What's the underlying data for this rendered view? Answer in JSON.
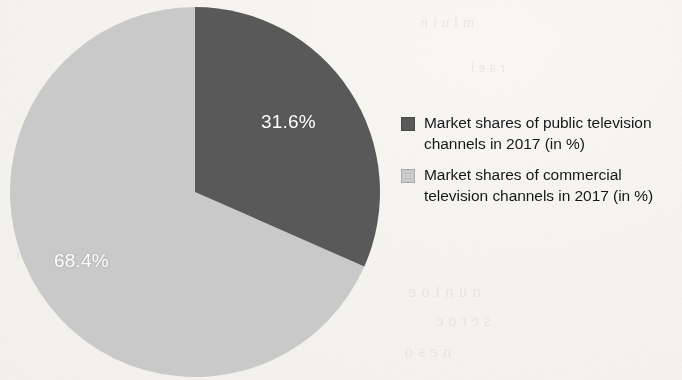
{
  "chart_data": {
    "type": "pie",
    "title": "",
    "subtitle": "",
    "xlabel": "",
    "ylabel": "",
    "units": "%",
    "legend_position": "right",
    "grid": false,
    "categories": [
      "Market shares of public television channels in 2017 (in %)",
      "Market shares of commercial television channels in 2017 (in %)"
    ],
    "values": [
      31.6,
      68.4
    ],
    "labels": [
      "31.6%",
      "68.4%"
    ],
    "colors": [
      "#595959",
      "#c9c9c9"
    ],
    "slices": [
      {
        "name": "Market shares of public television channels in 2017 (in %)",
        "value": 31.6,
        "label": "31.6%",
        "color": "#595959",
        "start_angle_deg": 0,
        "end_angle_deg": 113.76
      },
      {
        "name": "Market shares of commercial television channels in 2017 (in %)",
        "value": 68.4,
        "label": "68.4%",
        "color": "#c9c9c9",
        "start_angle_deg": 113.76,
        "end_angle_deg": 360
      }
    ]
  },
  "pie": {
    "slice_public_label": "31.6%",
    "slice_commercial_label": "68.4%",
    "center_x": 195,
    "center_y": 192,
    "radius": 185,
    "public_color": "#595959",
    "commercial_color": "#c9c9c9"
  },
  "legend": {
    "items": [
      {
        "label": "Market shares of public television channels in 2017 (in %)",
        "color": "#595959",
        "swatch": "dark-gray-square"
      },
      {
        "label": "Market shares of commercial television channels in 2017 (in %)",
        "color": "#c9c9c9",
        "swatch": "light-gray-square"
      }
    ]
  },
  "page": {
    "background_color": "#f8f7f4"
  }
}
